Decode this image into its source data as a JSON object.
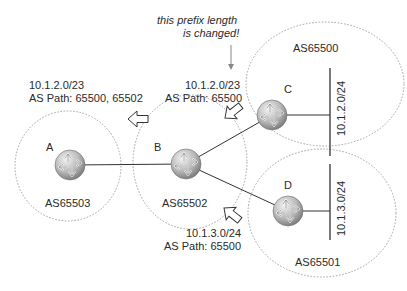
{
  "annotation": {
    "line1": "this prefix length",
    "line2": "is changed!"
  },
  "as_domains": [
    {
      "id": "A",
      "as": "AS65503"
    },
    {
      "id": "B",
      "as": "AS65502"
    },
    {
      "id": "C",
      "as": "AS65500",
      "network": "10.1.2.0/24"
    },
    {
      "id": "D",
      "as": "AS65501",
      "network": "10.1.3.0/24"
    }
  ],
  "routers": [
    {
      "label": "A"
    },
    {
      "label": "B"
    },
    {
      "label": "C"
    },
    {
      "label": "D"
    }
  ],
  "advertisements": [
    {
      "prefix": "10.1.2.0/23",
      "path": "AS Path: 65500, 65502"
    },
    {
      "prefix": "10.1.2.0/23",
      "path": "AS Path: 65500"
    },
    {
      "prefix": "10.1.3.0/24",
      "path": "AS Path: 65500"
    }
  ],
  "colors": {
    "router_light": "#e6e6e6",
    "router_dark": "#8a8a8a",
    "dashed_border": "#9a9a9a",
    "link": "#333333"
  }
}
